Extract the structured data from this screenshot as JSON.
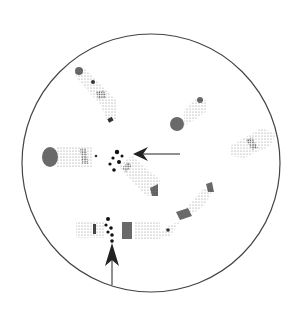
{
  "figure": {
    "field": {
      "cx": 151,
      "cy": 163,
      "r": 129,
      "stroke": "#444444"
    },
    "colors": {
      "dark": "#2a2a2a",
      "medium": "#666666",
      "light": "#9a9a9a",
      "background": "#ffffff"
    },
    "arrows": [
      {
        "name": "arrow-horizontal",
        "from": [
          180,
          154
        ],
        "to": [
          133,
          154
        ]
      },
      {
        "name": "arrow-vertical",
        "from": [
          112,
          285
        ],
        "to": [
          112,
          243
        ]
      }
    ]
  }
}
